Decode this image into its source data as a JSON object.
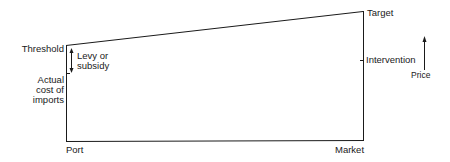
{
  "diagram": {
    "labels": {
      "threshold": "Threshold",
      "levy_line1": "Levy or",
      "levy_line2": "subsidy",
      "actual_line1": "Actual",
      "actual_line2": "cost of",
      "actual_line3": "imports",
      "target": "Target",
      "intervention": "Intervention",
      "price": "Price",
      "port": "Port",
      "market": "Market"
    },
    "colors": {
      "line": "#1a1a1a",
      "background": "#ffffff"
    }
  }
}
